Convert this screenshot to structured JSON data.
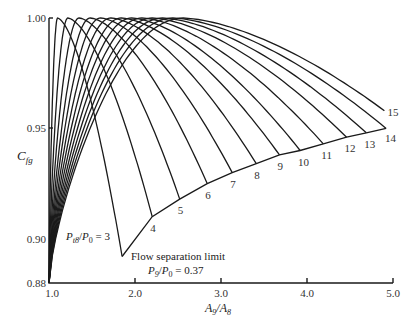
{
  "chart_data": {
    "type": "line",
    "title": "",
    "xlabel": "A9/A8",
    "ylabel": "Cfg",
    "xlim": [
      1.0,
      5.0
    ],
    "ylim": [
      0.88,
      1.0
    ],
    "grid": false,
    "x_ticks": [
      "1.0",
      "2.0",
      "3.0",
      "4.0",
      "5.0"
    ],
    "y_ticks": [
      "0.88",
      "0.90",
      "0.95",
      "1.00"
    ],
    "series_parameter": "P_t8/P_0",
    "series": [
      {
        "name": "3",
        "peak_x": 1.1,
        "end": [
          1.85,
          0.892
        ]
      },
      {
        "name": "4",
        "peak_x": 1.22,
        "end": [
          2.2,
          0.91
        ]
      },
      {
        "name": "5",
        "peak_x": 1.35,
        "end": [
          2.52,
          0.918
        ]
      },
      {
        "name": "6",
        "peak_x": 1.48,
        "end": [
          2.84,
          0.925
        ]
      },
      {
        "name": "7",
        "peak_x": 1.6,
        "end": [
          3.13,
          0.93
        ]
      },
      {
        "name": "8",
        "peak_x": 1.72,
        "end": [
          3.41,
          0.934
        ]
      },
      {
        "name": "9",
        "peak_x": 1.84,
        "end": [
          3.68,
          0.938
        ]
      },
      {
        "name": "10",
        "peak_x": 1.96,
        "end": [
          3.92,
          0.94
        ]
      },
      {
        "name": "11",
        "peak_x": 2.08,
        "end": [
          4.19,
          0.943
        ]
      },
      {
        "name": "12",
        "peak_x": 2.2,
        "end": [
          4.46,
          0.946
        ]
      },
      {
        "name": "13",
        "peak_x": 2.32,
        "end": [
          4.69,
          0.948
        ]
      },
      {
        "name": "14",
        "peak_x": 2.44,
        "end": [
          4.92,
          0.95
        ]
      },
      {
        "name": "15",
        "peak_x": 2.56,
        "end": [
          4.9,
          0.958
        ]
      }
    ],
    "separation_limit": {
      "label": "Flow separation limit",
      "sublabel": "P9/P0 = 0.37",
      "points": [
        [
          1.85,
          0.892
        ],
        [
          2.2,
          0.91
        ],
        [
          2.52,
          0.918
        ],
        [
          2.84,
          0.925
        ],
        [
          3.13,
          0.93
        ],
        [
          3.41,
          0.934
        ],
        [
          3.68,
          0.938
        ],
        [
          3.92,
          0.94
        ],
        [
          4.19,
          0.943
        ],
        [
          4.46,
          0.946
        ],
        [
          4.69,
          0.948
        ],
        [
          4.92,
          0.95
        ]
      ]
    },
    "annotations": [
      {
        "text": "Pt8/P0 = 3",
        "at": [
          1.6,
          0.898
        ]
      }
    ]
  },
  "labels": {
    "ylabel_main": "C",
    "ylabel_sub": "fg",
    "xlabel_a": "A",
    "xlabel_a_sub": "9",
    "xlabel_b": "A",
    "xlabel_b_sub": "8",
    "ann_p": "P",
    "ann_p_sub": "t8",
    "ann_p0": "P",
    "ann_p0_sub": "0",
    "ann_eq": " = 3",
    "sep_label": "Flow separation limit",
    "sep_p9": "P",
    "sep_p9_sub": "9",
    "sep_p0": "P",
    "sep_p0_sub": "0",
    "sep_eq": " = 0.37"
  }
}
